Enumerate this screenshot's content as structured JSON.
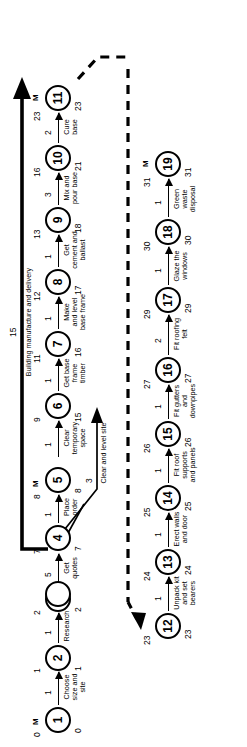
{
  "diagram": {
    "type": "network-analysis-pert-chart",
    "orientation": "rotated-90-ccw",
    "project_duration": 31,
    "critical_path_marker": "M"
  },
  "nodes": [
    {
      "id": "1",
      "earliest": "0",
      "latest": "0",
      "milestone": "M"
    },
    {
      "id": "2",
      "earliest": "1",
      "latest": "1",
      "milestone": ""
    },
    {
      "id": "3",
      "earliest": "2",
      "latest": "2",
      "milestone": ""
    },
    {
      "id": "4",
      "earliest": "7",
      "latest": "7",
      "milestone": ""
    },
    {
      "id": "5",
      "earliest": "8",
      "latest": "8",
      "milestone": "M"
    },
    {
      "id": "6",
      "earliest": "9",
      "latest": "15",
      "milestone": ""
    },
    {
      "id": "7",
      "earliest": "11",
      "latest": "16",
      "milestone": ""
    },
    {
      "id": "8",
      "earliest": "12",
      "latest": "17",
      "milestone": ""
    },
    {
      "id": "9",
      "earliest": "13",
      "latest": "18",
      "milestone": ""
    },
    {
      "id": "10",
      "earliest": "16",
      "latest": "21",
      "milestone": ""
    },
    {
      "id": "11",
      "earliest": "23",
      "latest": "23",
      "milestone": "M"
    },
    {
      "id": "12",
      "earliest": "23",
      "latest": "23",
      "milestone": ""
    },
    {
      "id": "13",
      "earliest": "24",
      "latest": "24",
      "milestone": ""
    },
    {
      "id": "14",
      "earliest": "25",
      "latest": "25",
      "milestone": ""
    },
    {
      "id": "15",
      "earliest": "26",
      "latest": "26",
      "milestone": ""
    },
    {
      "id": "16",
      "earliest": "27",
      "latest": "27",
      "milestone": ""
    },
    {
      "id": "17",
      "earliest": "29",
      "latest": "29",
      "milestone": ""
    },
    {
      "id": "18",
      "earliest": "30",
      "latest": "30",
      "milestone": ""
    },
    {
      "id": "19",
      "earliest": "31",
      "latest": "31",
      "milestone": "M"
    }
  ],
  "activities": [
    {
      "from": "1",
      "to": "2",
      "label": "Choose\nsize and\nsite",
      "duration": "1"
    },
    {
      "from": "2",
      "to": "3",
      "label": "Research",
      "duration": "1"
    },
    {
      "from": "3",
      "to": "4",
      "label": "Get\nquotes",
      "duration": "5"
    },
    {
      "from": "4",
      "to": "5",
      "label": "Place\norder",
      "duration": "1"
    },
    {
      "from": "5",
      "to": "11",
      "label": "Building manufacture and delivery",
      "duration": "15"
    },
    {
      "from": "5",
      "to": "7",
      "label": "Clear and level site",
      "duration": "3"
    },
    {
      "from": "5",
      "to": "6",
      "label": "Clear\ntemporary\nspace",
      "duration": "1"
    },
    {
      "from": "6",
      "to": "7",
      "label": "Get base\nframe\ntimber",
      "duration": "1"
    },
    {
      "from": "7",
      "to": "8",
      "label": "Make\nand level\nbase frame",
      "duration": "1"
    },
    {
      "from": "8",
      "to": "9",
      "label": "Get\ncement and\nballast",
      "duration": "1"
    },
    {
      "from": "9",
      "to": "10",
      "label": "Mix and\npour base",
      "duration": "3"
    },
    {
      "from": "10",
      "to": "11",
      "label": "Cure\nbase",
      "duration": "2"
    },
    {
      "from": "12",
      "to": "13",
      "label": "Unpack kit\nand set\nbearers",
      "duration": "1"
    },
    {
      "from": "13",
      "to": "14",
      "label": "Erect walls\nand door",
      "duration": "1"
    },
    {
      "from": "14",
      "to": "15",
      "label": "Fit roof\nsupports\nand panels",
      "duration": "1"
    },
    {
      "from": "15",
      "to": "16",
      "label": "Fit gutters\nand\ndownpipes",
      "duration": "1"
    },
    {
      "from": "16",
      "to": "17",
      "label": "Fit roofing\nfelt",
      "duration": "2"
    },
    {
      "from": "17",
      "to": "18",
      "label": "Glaze the\nwindows",
      "duration": "1"
    },
    {
      "from": "18",
      "to": "19",
      "label": "Green\nwaste\ndisposal",
      "duration": "1"
    }
  ]
}
